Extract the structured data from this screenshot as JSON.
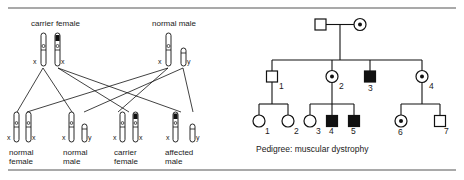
{
  "figure": {
    "title_caption": "Pedigree: muscular dystrophy",
    "left_panel": {
      "name": "x-linked-inheritance-chromosome-cross",
      "parents": [
        {
          "id": "carrier-female",
          "label": "carrier female",
          "gametes": [
            {
              "allele_label": "x",
              "band": false
            },
            {
              "allele_label": "x",
              "band": true
            }
          ]
        },
        {
          "id": "normal-male",
          "label": "normal male",
          "gametes": [
            {
              "allele_label": "x",
              "band": false
            },
            {
              "allele_label": "y",
              "band": false,
              "short": true
            }
          ]
        }
      ],
      "offspring": [
        {
          "id": "normal-female",
          "label_line1": "normal",
          "label_line2": "female",
          "chromosomes": [
            {
              "allele_label": "x",
              "band": false
            },
            {
              "allele_label": "x",
              "band": false
            }
          ]
        },
        {
          "id": "normal-male",
          "label_line1": "normal",
          "label_line2": "male",
          "chromosomes": [
            {
              "allele_label": "x",
              "band": false
            },
            {
              "allele_label": "y",
              "band": false,
              "short": true
            }
          ]
        },
        {
          "id": "carrier-female",
          "label_line1": "carrier",
          "label_line2": "female",
          "chromosomes": [
            {
              "allele_label": "x",
              "band": false
            },
            {
              "allele_label": "x",
              "band": true
            }
          ]
        },
        {
          "id": "affected-male",
          "label_line1": "affected",
          "label_line2": "male",
          "chromosomes": [
            {
              "allele_label": "x",
              "band": true
            },
            {
              "allele_label": "y",
              "band": false,
              "short": true
            }
          ]
        }
      ]
    },
    "right_panel": {
      "name": "pedigree-chart",
      "caption": "Pedigree: muscular dystrophy",
      "generations": [
        {
          "id": "generation-1",
          "members": [
            {
              "number": "",
              "sex": "male",
              "status": "unaffected"
            },
            {
              "number": "",
              "sex": "female",
              "status": "carrier"
            }
          ]
        },
        {
          "id": "generation-2",
          "members": [
            {
              "number": "1",
              "sex": "male",
              "status": "unaffected"
            },
            {
              "number": "2",
              "sex": "female",
              "status": "carrier"
            },
            {
              "number": "3",
              "sex": "male",
              "status": "affected"
            },
            {
              "number": "4",
              "sex": "female",
              "status": "carrier"
            }
          ]
        },
        {
          "id": "generation-3",
          "members": [
            {
              "number": "1",
              "sex": "female",
              "status": "unaffected"
            },
            {
              "number": "2",
              "sex": "female",
              "status": "unaffected"
            },
            {
              "number": "3",
              "sex": "female",
              "status": "unaffected"
            },
            {
              "number": "4",
              "sex": "male",
              "status": "affected"
            },
            {
              "number": "5",
              "sex": "male",
              "status": "affected"
            },
            {
              "number": "6",
              "sex": "female",
              "status": "carrier"
            },
            {
              "number": "7",
              "sex": "male",
              "status": "unaffected"
            }
          ]
        }
      ]
    },
    "colors": {
      "ink": "#111111",
      "rule": "#555555",
      "background": "#ffffff"
    }
  }
}
